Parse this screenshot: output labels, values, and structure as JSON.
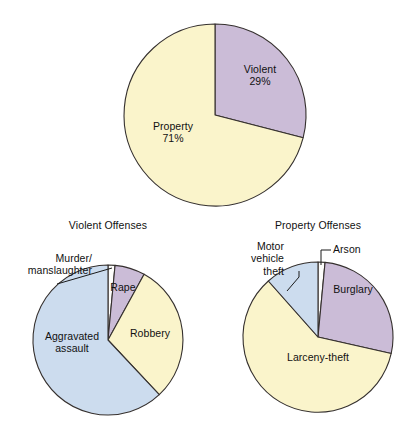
{
  "figure": {
    "background_color": "#ffffff",
    "stroke_color": "#35302e"
  },
  "palette": {
    "yellow": "#faf4cb",
    "purple": "#cbbcd7",
    "blue": "#ccdcee",
    "white": "#fdfdfb"
  },
  "chart_data": [
    {
      "type": "pie",
      "id": "crime-index-offenses",
      "title": "",
      "categories": [
        "Violent",
        "Property"
      ],
      "values": [
        29,
        71
      ],
      "value_unit": "%",
      "labels": [
        "Violent\n29%",
        "Property\n71%"
      ],
      "colors": [
        "#cbbcd7",
        "#faf4cb"
      ],
      "start_angle_deg": 0,
      "direction": "clockwise",
      "legend": "none",
      "grid": false
    },
    {
      "type": "pie",
      "id": "violent-offenses",
      "title": "Violent Offenses",
      "categories": [
        "Murder/manslaughter",
        "Rape",
        "Robbery",
        "Aggravated assault"
      ],
      "values": [
        1.5,
        6.5,
        30,
        62
      ],
      "value_unit": "%",
      "colors": [
        "#fdfdfb",
        "#cbbcd7",
        "#faf4cb",
        "#ccdcee"
      ],
      "start_angle_deg": 0,
      "direction": "clockwise",
      "legend": "none",
      "grid": false
    },
    {
      "type": "pie",
      "id": "property-offenses",
      "title": "Property Offenses",
      "categories": [
        "Arson",
        "Burglary",
        "Larceny-theft",
        "Motor vehicle theft"
      ],
      "values": [
        1.5,
        20,
        67,
        11.5
      ],
      "value_unit": "%",
      "colors": [
        "#fdfdfb",
        "#cbbcd7",
        "#faf4cb",
        "#ccdcee"
      ],
      "start_angle_deg": 0,
      "direction": "clockwise",
      "legend": "none",
      "grid": false
    }
  ],
  "top_chart": {
    "violent_label": "Violent\n29%",
    "property_label": "Property\n71%"
  },
  "violent_chart": {
    "title": "Violent Offenses",
    "murder_label": "Murder/\nmanslaughter",
    "rape_label": "Rape",
    "robbery_label": "Robbery",
    "aggravated_label": "Aggravated\nassault"
  },
  "property_chart": {
    "title": "Property Offenses",
    "motor_label": "Motor\nvehicle\ntheft",
    "arson_label": "Arson",
    "burglary_label": "Burglary",
    "larceny_label": "Larceny-theft"
  }
}
